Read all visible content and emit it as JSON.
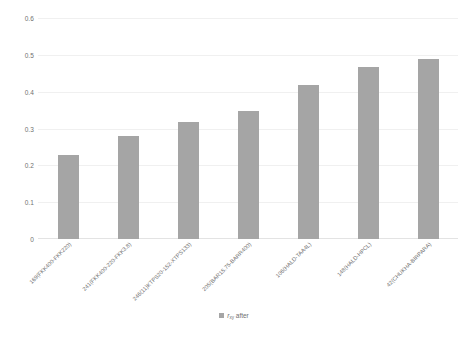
{
  "chart_data": {
    "type": "bar",
    "title": "",
    "xlabel": "",
    "ylabel": "",
    "ylim": [
      0,
      0.6
    ],
    "ytick_labels": [
      "0.6",
      "0.5",
      "0.4",
      "0.3",
      "0.2",
      "0.1",
      "0"
    ],
    "ytick_values": [
      0.6,
      0.5,
      0.4,
      0.3,
      0.2,
      0.1,
      0
    ],
    "grid": true,
    "legend_position": "bottom",
    "bar_color": "#a5a5a5",
    "categories": [
      "169(FKK400-FKK220)",
      "241(FKK400-220-FKK3.8)",
      "246(11)KTPS20-152-XTPS133)",
      "205(BAR15.75-BARR400)",
      "106(HALD-TAA4L)",
      "148(HALD-HPCL)",
      "42(CHUKHA-BIRPARA)"
    ],
    "series": [
      {
        "name": "r_xy after",
        "values": [
          0.23,
          0.28,
          0.32,
          0.35,
          0.42,
          0.47,
          0.49
        ]
      }
    ],
    "legend": {
      "symbol": "r",
      "subscript": "xy",
      "suffix": " after"
    }
  }
}
